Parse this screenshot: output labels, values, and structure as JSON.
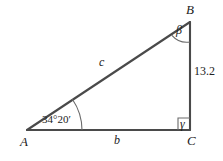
{
  "figure": {
    "type": "right-triangle-diagram",
    "background_color": "#ffffff",
    "stroke_color": "#4a4a4a",
    "text_color": "#222222",
    "vertices": {
      "A": {
        "label": "A",
        "x": 27,
        "y": 130
      },
      "B": {
        "label": "B",
        "x": 190,
        "y": 22
      },
      "C": {
        "label": "C",
        "x": 190,
        "y": 130
      }
    },
    "sides": {
      "hypotenuse": {
        "label": "c",
        "from": "A",
        "to": "B"
      },
      "base": {
        "label": "b",
        "from": "A",
        "to": "C"
      },
      "vertical": {
        "label": "13.2",
        "from": "C",
        "to": "B"
      }
    },
    "angles": {
      "at_A": {
        "label": "34°20′",
        "arc_radius": 55
      },
      "at_B": {
        "label": "β",
        "arc_radius": 20
      },
      "at_C": {
        "label": "γ",
        "marker": "right-angle-square",
        "size": 12
      }
    }
  }
}
